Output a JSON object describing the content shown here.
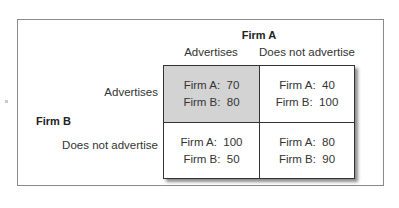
{
  "diagram": {
    "type": "payoff-matrix",
    "column_player": "Firm A",
    "row_player": "Firm B",
    "columns": [
      "Advertises",
      "Does not advertise"
    ],
    "rows": [
      "Advertises",
      "Does not advertise"
    ],
    "cells": [
      [
        {
          "a": "Firm A:  70",
          "b": "Firm B:  80",
          "shaded": true
        },
        {
          "a": "Firm A:  40",
          "b": "Firm B:  100",
          "shaded": false
        }
      ],
      [
        {
          "a": "Firm A:  100",
          "b": "Firm B:  50",
          "shaded": false
        },
        {
          "a": "Firm A:  80",
          "b": "Firm B:  90",
          "shaded": false
        }
      ]
    ],
    "colors": {
      "shaded_cell": "#d3d3d3",
      "border": "#333333",
      "frame": "#8a8a8a"
    }
  }
}
